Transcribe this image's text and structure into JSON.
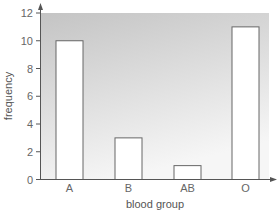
{
  "chart_data": {
    "type": "bar",
    "title": "",
    "xlabel": "blood group",
    "ylabel": "frequency",
    "categories": [
      "A",
      "B",
      "AB",
      "O"
    ],
    "values": [
      10,
      3,
      1,
      11
    ],
    "ylim": [
      0,
      12
    ],
    "yticks": [
      0,
      2,
      4,
      6,
      8,
      10,
      12
    ],
    "grid": false,
    "legend": null,
    "colors": {
      "bar_fill": "#ffffff",
      "bar_stroke": "#666666",
      "plot_bg_top": "#c8c8c8",
      "plot_bg_bottom": "#f4f4f4",
      "axis": "#555555"
    }
  }
}
